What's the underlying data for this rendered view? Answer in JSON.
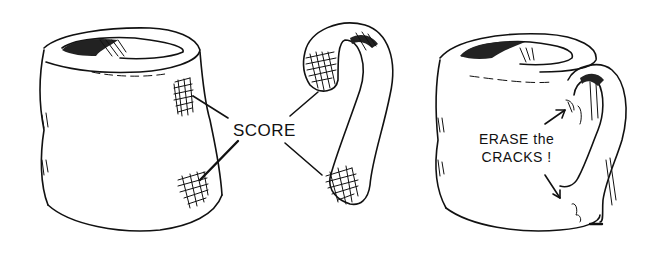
{
  "illustration": {
    "style": "black ink pen sketch on white",
    "panels": [
      {
        "id": "mug-body",
        "description": "Cylindrical clay mug body with two cross-hatched scored patches on right side"
      },
      {
        "id": "handle",
        "description": "Separate curved clay handle with cross-hatched scored patches at each end"
      },
      {
        "id": "assembled-mug",
        "description": "Mug with handle attached, arrows pointing at joints"
      }
    ],
    "labels": {
      "score": "SCORE",
      "erase_line1": "ERASE the",
      "erase_line2": "CRACKS !"
    },
    "colors": {
      "ink": "#111111",
      "background": "#ffffff"
    }
  }
}
